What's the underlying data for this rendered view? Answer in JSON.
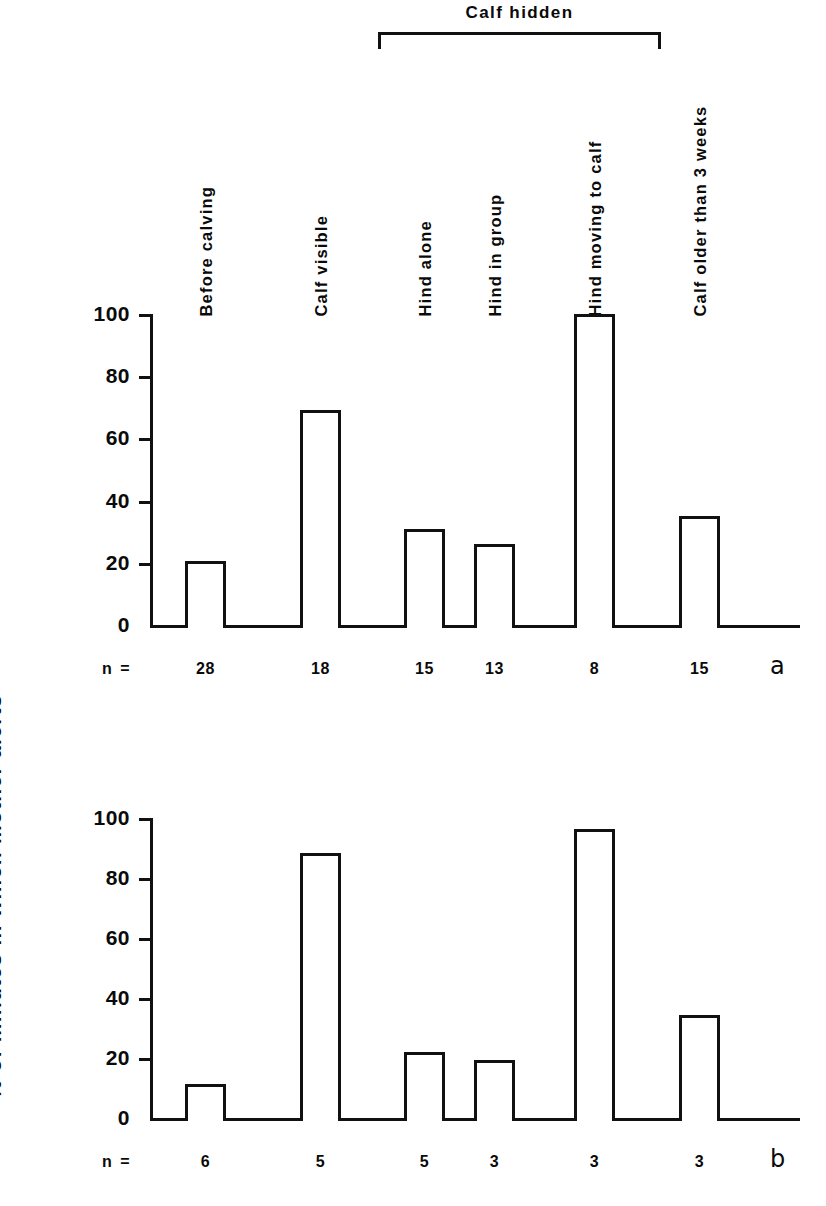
{
  "figure": {
    "y_axis_title": "% of minutes in which mother alerts",
    "group_bracket_label": "Calf  hidden",
    "n_prefix": "n",
    "n_equals": "=",
    "panel_a_letter": "a",
    "panel_b_letter": "b"
  },
  "categories": [
    "Before  calving",
    "Calf  visible",
    "Hind  alone",
    "Hind  in  group",
    "Hind  moving  to  calf",
    "Calf  older  than  3  weeks"
  ],
  "ticks": [
    "0",
    "20",
    "40",
    "60",
    "80",
    "100"
  ],
  "chart_data": [
    {
      "type": "bar",
      "title": "a",
      "panel": "a",
      "categories": [
        "Before calving",
        "Calf visible",
        "Hind alone",
        "Hind in group",
        "Hind moving to calf",
        "Calf older than 3 weeks"
      ],
      "values": [
        20.5,
        69,
        31,
        26,
        100,
        35
      ],
      "n": [
        28,
        18,
        15,
        13,
        8,
        15
      ],
      "xlabel": "",
      "ylabel": "% of minutes in which mother alerts",
      "ylim": [
        0,
        100
      ],
      "yticks": [
        0,
        20,
        40,
        60,
        80,
        100
      ],
      "grid": false,
      "legend": "none",
      "annotations": [
        {
          "text": "Calf hidden",
          "spans_categories": [
            "Hind alone",
            "Hind in group",
            "Hind moving to calf"
          ]
        }
      ]
    },
    {
      "type": "bar",
      "title": "b",
      "panel": "b",
      "categories": [
        "Before calving",
        "Calf visible",
        "Hind alone",
        "Hind in group",
        "Hind moving to calf",
        "Calf older than 3 weeks"
      ],
      "values": [
        11.5,
        88.5,
        22,
        19.5,
        96.5,
        34.5
      ],
      "n": [
        6,
        5,
        5,
        3,
        3,
        3
      ],
      "xlabel": "",
      "ylabel": "% of minutes in which mother alerts",
      "ylim": [
        0,
        100
      ],
      "yticks": [
        0,
        20,
        40,
        60,
        80,
        100
      ],
      "grid": false,
      "legend": "none",
      "annotations": [
        {
          "text": "Calf hidden",
          "spans_categories": [
            "Hind alone",
            "Hind in group",
            "Hind moving to calf"
          ]
        }
      ]
    }
  ],
  "colors": {
    "ink": "#111111",
    "background": "#ffffff"
  }
}
